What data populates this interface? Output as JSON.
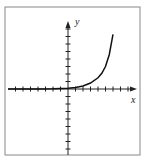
{
  "chart_data": {
    "type": "line",
    "title": "",
    "xlabel": "x",
    "ylabel": "y",
    "xlim": [
      -8,
      9
    ],
    "ylim": [
      -9,
      9
    ],
    "grid": false,
    "tick_spacing": 1,
    "series": [
      {
        "name": "curve",
        "x": [
          -8,
          -6,
          -4,
          -2,
          0,
          1,
          2,
          3,
          4,
          4.5,
          5,
          5.5,
          6
        ],
        "y": [
          0.0,
          0.0,
          0.01,
          0.03,
          0.1,
          0.2,
          0.4,
          0.8,
          1.5,
          2.1,
          3.0,
          4.6,
          7.3
        ]
      }
    ],
    "colors": {
      "axis": "#222222",
      "curve": "#111111",
      "frame": "#888888"
    }
  },
  "labels": {
    "x": "x",
    "y": "y"
  }
}
